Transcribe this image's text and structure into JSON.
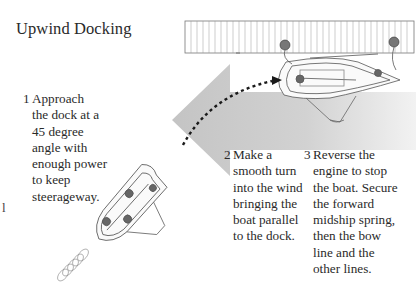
{
  "title": "Upwind Docking",
  "steps": [
    {
      "number": "1",
      "lines": [
        "Approach",
        "the dock at a",
        "45 degree",
        "angle with",
        "enough power",
        "to keep",
        "steerageway."
      ]
    },
    {
      "number": "2",
      "lines": [
        "Make a",
        "smooth turn",
        "into the wind",
        "bringing the",
        "boat parallel",
        "to the dock."
      ]
    },
    {
      "number": "3",
      "lines": [
        "Reverse the",
        "engine to stop",
        "the boat. Secure",
        "the forward",
        "midship spring,",
        "then the bow",
        "line and the",
        "other lines."
      ]
    }
  ],
  "stray_mark": "l",
  "colors": {
    "wind_arrow": "#c8c8c8",
    "path": "#1a1a1a",
    "lines": "#555555",
    "dock_fill": "#ffffff"
  }
}
